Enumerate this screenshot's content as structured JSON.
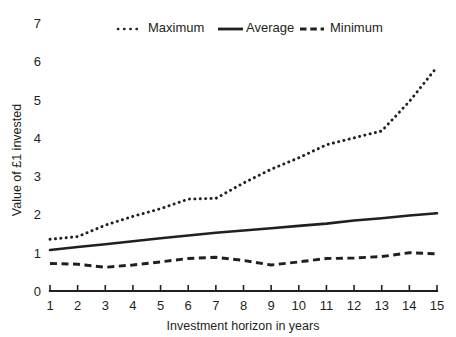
{
  "chart_data": {
    "type": "line",
    "title": "",
    "xlabel": "Investment horizon in years",
    "ylabel": "Value of £1 invested",
    "x": [
      1,
      2,
      3,
      4,
      5,
      6,
      7,
      8,
      9,
      10,
      11,
      12,
      13,
      14,
      15
    ],
    "xlim": [
      1,
      15
    ],
    "ylim": [
      0,
      7
    ],
    "xticks": [
      "1",
      "2",
      "3",
      "4",
      "5",
      "6",
      "7",
      "8",
      "9",
      "10",
      "11",
      "12",
      "13",
      "14",
      "15"
    ],
    "yticks": [
      "0",
      "1",
      "2",
      "3",
      "4",
      "5",
      "6",
      "7"
    ],
    "grid": false,
    "legend_position": "top-center",
    "series": [
      {
        "name": "Maximum",
        "style": "dotted",
        "color": "#231f20",
        "values": [
          1.35,
          1.42,
          1.72,
          1.95,
          2.15,
          2.4,
          2.42,
          2.82,
          3.18,
          3.48,
          3.82,
          4.0,
          4.18,
          4.95,
          5.85
        ]
      },
      {
        "name": "Average",
        "style": "solid",
        "color": "#231f20",
        "values": [
          1.07,
          1.15,
          1.22,
          1.3,
          1.38,
          1.45,
          1.52,
          1.58,
          1.64,
          1.7,
          1.76,
          1.84,
          1.9,
          1.97,
          2.03
        ]
      },
      {
        "name": "Minimum",
        "style": "dashed",
        "color": "#231f20",
        "values": [
          0.72,
          0.7,
          0.62,
          0.68,
          0.76,
          0.85,
          0.88,
          0.8,
          0.68,
          0.76,
          0.85,
          0.86,
          0.9,
          1.0,
          0.97
        ]
      }
    ]
  },
  "legend": {
    "items": [
      {
        "label": "Maximum"
      },
      {
        "label": "Average"
      },
      {
        "label": "Minimum"
      }
    ]
  },
  "axes": {
    "x_title": "Investment horizon in years",
    "y_title": "Value of £1 invested"
  }
}
